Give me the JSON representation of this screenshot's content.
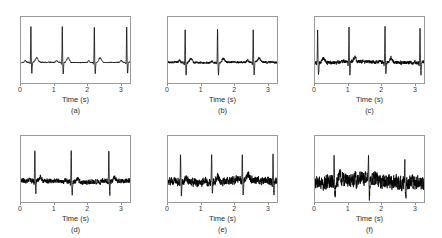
{
  "figure": {
    "rows": 2,
    "cols": 3,
    "background": "#ffffff",
    "trace_color": "#000000",
    "axis_color": "#9a9a9a"
  },
  "axis": {
    "xlabel": "Time (s)",
    "tick_labels": [
      "0",
      "1",
      "2",
      "3"
    ],
    "tick_values": [
      0,
      1,
      2,
      3
    ],
    "xlim": [
      0,
      3.3
    ],
    "ylim": [
      -1.0,
      2.2
    ],
    "grid": false
  },
  "chart_data": {
    "type": "line",
    "title": "",
    "xlabel": "Time (s)",
    "ylabel": "",
    "xlim": [
      0,
      3.3
    ],
    "ylim": [
      -1.0,
      2.2
    ],
    "grid": false,
    "legend": "none",
    "panels": [
      {
        "caption": "(a)",
        "xlabel": "Time (s)",
        "tick_labels": [
          "0",
          "1",
          "2",
          "3"
        ],
        "noise_amplitude": 0.02,
        "r_peak_times": [
          0.3,
          1.25,
          2.22,
          3.2
        ],
        "r_peak_amplitude": 1.75,
        "s_dip_amplitude": -0.55,
        "t_wave_amplitude": 0.22,
        "p_wave_amplitude": 0.09
      },
      {
        "caption": "(b)",
        "xlabel": "Time (s)",
        "tick_labels": [
          "0",
          "1",
          "2",
          "3"
        ],
        "noise_amplitude": 0.045,
        "r_peak_times": [
          0.52,
          1.5,
          2.58
        ],
        "r_peak_amplitude": 1.62,
        "s_dip_amplitude": -0.6,
        "t_wave_amplitude": 0.2,
        "p_wave_amplitude": 0.08
      },
      {
        "caption": "(c)",
        "xlabel": "Time (s)",
        "tick_labels": [
          "0",
          "1",
          "2",
          "3"
        ],
        "noise_amplitude": 0.075,
        "r_peak_times": [
          0.08,
          1.03,
          2.12,
          3.18
        ],
        "r_peak_amplitude": 1.7,
        "s_dip_amplitude": -0.58,
        "t_wave_amplitude": 0.22,
        "p_wave_amplitude": 0.08
      },
      {
        "caption": "(d)",
        "xlabel": "Time (s)",
        "tick_labels": [
          "0",
          "1",
          "2",
          "3"
        ],
        "noise_amplitude": 0.1,
        "r_peak_times": [
          0.42,
          1.52,
          2.66
        ],
        "r_peak_amplitude": 1.5,
        "s_dip_amplitude": -0.62,
        "t_wave_amplitude": 0.18,
        "p_wave_amplitude": 0.07
      },
      {
        "caption": "(e)",
        "xlabel": "Time (s)",
        "tick_labels": [
          "0",
          "1",
          "2",
          "3"
        ],
        "noise_amplitude": 0.16,
        "r_peak_times": [
          0.38,
          1.32,
          2.25,
          3.18
        ],
        "r_peak_amplitude": 1.4,
        "s_dip_amplitude": -0.65,
        "t_wave_amplitude": 0.26,
        "p_wave_amplitude": 0.07
      },
      {
        "caption": "(f)",
        "xlabel": "Time (s)",
        "tick_labels": [
          "0",
          "1",
          "2",
          "3"
        ],
        "noise_amplitude": 0.3,
        "r_peak_times": [
          0.58,
          1.62,
          2.72
        ],
        "r_peak_amplitude": 1.25,
        "s_dip_amplitude": -0.7,
        "t_wave_amplitude": 0.22,
        "p_wave_amplitude": 0.06
      }
    ]
  }
}
